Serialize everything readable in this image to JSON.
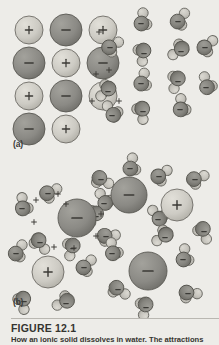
{
  "figure": {
    "number_label": "FIGURE 12.1",
    "caption": "How an ionic solid dissolves in water.  The attractions",
    "panel_a_label": "(a)",
    "panel_b_label": "(b)"
  },
  "colors": {
    "background": "#edece8",
    "cation_fill": "#cdcbc4",
    "cation_stroke": "#6e6c66",
    "anion_fill": "#8b8a85",
    "anion_stroke": "#5a5954",
    "oxygen_fill": "#86857f",
    "oxygen_stroke": "#56554f",
    "hydrogen_fill": "#c6c4bd",
    "hydrogen_stroke": "#6b6a64",
    "charge_mark": "#3b3a36",
    "caption_text": "#35342f"
  },
  "chart_data": {
    "type": "diagram",
    "title": "How an ionic solid dissolves in water",
    "panels": [
      {
        "id": "a",
        "label": "(a)",
        "description": "Ionic crystal lattice of alternating cations and anions adjacent to bulk water molecules",
        "lattice": {
          "rows": 4,
          "columns": 3,
          "origin_x": 29,
          "origin_y": 30,
          "spacing_x": 37,
          "spacing_y": 33,
          "cation_radius": 14,
          "anion_radius": 16,
          "pattern": [
            [
              "+",
              "-",
              "+"
            ],
            [
              "-",
              "+",
              "-"
            ],
            [
              "+",
              "-",
              "+"
            ],
            [
              "-",
              "+",
              "-"
            ]
          ],
          "omitted_cells": [
            "3,2"
          ]
        },
        "water_molecules": [
          {
            "x": 141,
            "y": 22,
            "rot": -18
          },
          {
            "x": 178,
            "y": 20,
            "rot": 14
          },
          {
            "x": 144,
            "y": 52,
            "rot": 160
          },
          {
            "x": 181,
            "y": 50,
            "rot": -150
          },
          {
            "x": 205,
            "y": 46,
            "rot": 25
          },
          {
            "x": 141,
            "y": 82,
            "rot": -10
          },
          {
            "x": 178,
            "y": 80,
            "rot": 175
          },
          {
            "x": 206,
            "y": 86,
            "rot": -40
          },
          {
            "x": 143,
            "y": 110,
            "rot": 150
          },
          {
            "x": 180,
            "y": 108,
            "rot": -25
          },
          {
            "x": 110,
            "y": 46,
            "rot": 35
          },
          {
            "x": 108,
            "y": 90,
            "rot": 200
          },
          {
            "x": 112,
            "y": 114,
            "rot": -60
          }
        ],
        "charge_marks": [
          {
            "x": 99,
            "y": 32,
            "sign": "+"
          },
          {
            "x": 96,
            "y": 74,
            "sign": "+"
          },
          {
            "x": 109,
            "y": 70,
            "sign": "+"
          },
          {
            "x": 92,
            "y": 101,
            "sign": "+"
          },
          {
            "x": 119,
            "y": 101,
            "sign": "+"
          }
        ]
      },
      {
        "id": "b",
        "label": "(b)",
        "description": "Dissolved (hydrated) ions, each surrounded by a shell of oriented water molecules",
        "solvated_ions": [
          {
            "x": 77,
            "y": 218,
            "sign": "-",
            "radius": 19
          },
          {
            "x": 48,
            "y": 272,
            "sign": "+",
            "radius": 16
          },
          {
            "x": 129,
            "y": 195,
            "sign": "-",
            "radius": 18
          },
          {
            "x": 177,
            "y": 205,
            "sign": "+",
            "radius": 16
          },
          {
            "x": 148,
            "y": 271,
            "sign": "-",
            "radius": 19
          }
        ],
        "water_molecules": [
          {
            "x": 48,
            "y": 192,
            "rot": 40
          },
          {
            "x": 22,
            "y": 207,
            "rot": -30
          },
          {
            "x": 40,
            "y": 241,
            "rot": 120
          },
          {
            "x": 73,
            "y": 247,
            "rot": 170
          },
          {
            "x": 104,
            "y": 202,
            "rot": -55
          },
          {
            "x": 106,
            "y": 235,
            "rot": 60
          },
          {
            "x": 16,
            "y": 252,
            "rot": 10
          },
          {
            "x": 24,
            "y": 300,
            "rot": 150
          },
          {
            "x": 66,
            "y": 302,
            "rot": -140
          },
          {
            "x": 84,
            "y": 266,
            "rot": 20
          },
          {
            "x": 101,
            "y": 178,
            "rot": 95
          },
          {
            "x": 130,
            "y": 167,
            "rot": -15
          },
          {
            "x": 159,
            "y": 175,
            "rot": 30
          },
          {
            "x": 96,
            "y": 215,
            "rot": 185
          },
          {
            "x": 158,
            "y": 218,
            "rot": -65
          },
          {
            "x": 195,
            "y": 178,
            "rot": 45
          },
          {
            "x": 204,
            "y": 230,
            "rot": 135
          },
          {
            "x": 112,
            "y": 252,
            "rot": -35
          },
          {
            "x": 118,
            "y": 288,
            "rot": 100
          },
          {
            "x": 146,
            "y": 306,
            "rot": 165
          },
          {
            "x": 183,
            "y": 258,
            "rot": -20
          },
          {
            "x": 188,
            "y": 292,
            "rot": 70
          },
          {
            "x": 165,
            "y": 236,
            "rot": 210
          }
        ],
        "charge_marks": [
          {
            "x": 36,
            "y": 200,
            "sign": "+"
          },
          {
            "x": 58,
            "y": 194,
            "sign": "+"
          },
          {
            "x": 66,
            "y": 204,
            "sign": "+"
          },
          {
            "x": 34,
            "y": 222,
            "sign": "+"
          },
          {
            "x": 101,
            "y": 214,
            "sign": "+"
          },
          {
            "x": 96,
            "y": 236,
            "sign": "+"
          },
          {
            "x": 74,
            "y": 248,
            "sign": "+"
          },
          {
            "x": 54,
            "y": 247,
            "sign": "+"
          }
        ]
      }
    ]
  }
}
